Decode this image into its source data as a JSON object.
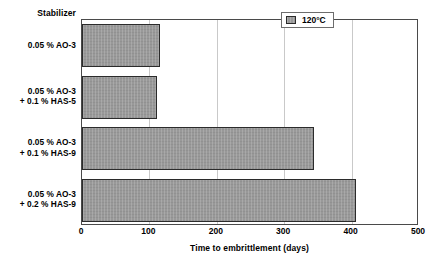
{
  "chart_data": {
    "type": "bar",
    "orientation": "horizontal",
    "title": "",
    "category_axis_title": "Stabilizer",
    "xlabel": "Time to embrittlement (days)",
    "ylabel": "",
    "xlim": [
      0,
      500
    ],
    "xticks": [
      0,
      100,
      200,
      300,
      400,
      500
    ],
    "xtick_labels": [
      "0",
      "100",
      "200",
      "300",
      "400",
      "500"
    ],
    "grid": "vertical",
    "legend_position": "top-right",
    "categories": [
      "0.05 % AO-3",
      "0.05 % AO-3\n+ 0.1 % HAS-5",
      "0.05 % AO-3\n+ 0.1 % HAS-9",
      "0.05 % AO-3\n+ 0.2 % HAS-9"
    ],
    "category_lines": [
      [
        "0.05 % AO-3"
      ],
      [
        "0.05 % AO-3",
        "+ 0.1 % HAS-5"
      ],
      [
        "0.05 % AO-3",
        "+ 0.1 % HAS-9"
      ],
      [
        "0.05 % AO-3",
        "+ 0.2 % HAS-9"
      ]
    ],
    "series": [
      {
        "name": "120°C",
        "color": "#999999",
        "values": [
          116,
          111,
          344,
          406
        ]
      }
    ]
  },
  "legend": {
    "entries": [
      {
        "label": "120°C",
        "swatch_name": "legend-swatch-120c"
      }
    ]
  },
  "axis": {
    "x_title": "Time to embrittlement (days)",
    "category_header": "Stabilizer"
  }
}
